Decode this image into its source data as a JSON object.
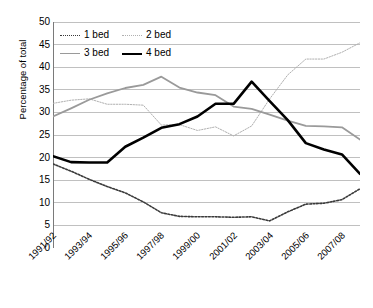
{
  "chart_data": {
    "type": "line",
    "title": "",
    "xlabel": "",
    "ylabel": "Percentage of total",
    "ylim": [
      0,
      50
    ],
    "ytick_step": 5,
    "grid": true,
    "legend_position": "top-left",
    "yticks": [
      "50",
      "45",
      "40",
      "35",
      "30",
      "25",
      "20",
      "15",
      "10",
      "5",
      "0"
    ],
    "categories": [
      "1991/92",
      "1992/93",
      "1993/94",
      "1994/95",
      "1995/96",
      "1996/97",
      "1997/98",
      "1998/99",
      "1999/00",
      "2000/01",
      "2001/02",
      "2002/03",
      "2003/04",
      "2004/05",
      "2005/06",
      "2006/07",
      "2007/08",
      "2008/09"
    ],
    "xtick_labels": [
      "1991/92",
      "1993/94",
      "1995/96",
      "1997/98",
      "1999/00",
      "2001/02",
      "2003/04",
      "2005/06",
      "2007/08"
    ],
    "series": [
      {
        "name": "1 bed",
        "style": "dotted",
        "color": "#3a3a3a",
        "width": 1.6,
        "values": [
          18.6,
          17.0,
          15.2,
          13.6,
          12.2,
          10.2,
          7.8,
          7.0,
          6.9,
          6.9,
          6.8,
          6.9,
          6.0,
          8.0,
          9.7,
          9.9,
          10.7,
          13.1
        ]
      },
      {
        "name": "2 bed",
        "style": "dotted",
        "color": "#b0b0b0",
        "width": 1.0,
        "values": [
          32.0,
          32.7,
          33.0,
          31.8,
          31.8,
          31.6,
          27.2,
          27.3,
          26.0,
          26.8,
          24.8,
          27.0,
          33.0,
          38.3,
          41.8,
          41.8,
          43.3,
          45.4
        ]
      },
      {
        "name": "3 bed",
        "style": "solid",
        "color": "#9a9a9a",
        "width": 1.8,
        "values": [
          29.1,
          30.9,
          32.8,
          34.2,
          35.4,
          36.1,
          37.9,
          35.5,
          34.4,
          33.8,
          31.3,
          30.8,
          29.5,
          28.2,
          27.0,
          26.9,
          26.7,
          24.0
        ]
      },
      {
        "name": "4 bed",
        "style": "solid",
        "color": "#000000",
        "width": 2.6,
        "values": [
          20.3,
          19.0,
          18.9,
          18.9,
          22.4,
          24.4,
          26.6,
          27.4,
          29.1,
          31.9,
          31.9,
          36.8,
          32.5,
          28.3,
          23.2,
          21.8,
          20.7,
          16.4
        ]
      }
    ]
  }
}
